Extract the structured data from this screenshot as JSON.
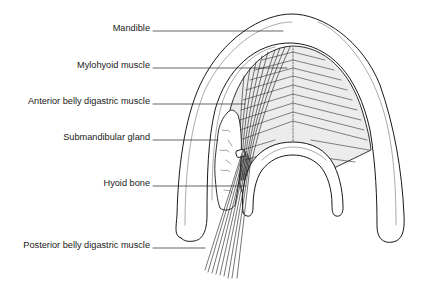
{
  "figure": {
    "type": "anatomical line drawing",
    "colors": {
      "line": "#1a1a1a",
      "muscle_fill": "#ececec",
      "background": "#ffffff"
    }
  },
  "labels": [
    {
      "id": "mandible",
      "text": "Mandible",
      "y": 31,
      "line_end_x": 283
    },
    {
      "id": "mylohyoid",
      "text": "Mylohyoid muscle",
      "y": 68,
      "line_end_x": 287
    },
    {
      "id": "anterior-belly",
      "text": "Anterior belly digastric muscle",
      "y": 104,
      "line_end_x": 245
    },
    {
      "id": "submandibular",
      "text": "Submandibular gland",
      "y": 140,
      "line_end_x": 218
    },
    {
      "id": "hyoid",
      "text": "Hyoid bone",
      "y": 186,
      "line_end_x": 246
    },
    {
      "id": "posterior-belly",
      "text": "Posterior belly digastric muscle",
      "y": 248,
      "line_end_x": 205
    }
  ]
}
